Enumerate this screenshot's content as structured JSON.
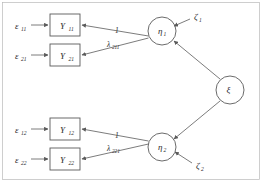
{
  "diagram": {
    "type": "sem-path-diagram",
    "colors": {
      "stroke": "#5a5a5a",
      "text": "#2b2b2b",
      "background": "#ffffff",
      "frame": "#b9b9b9"
    },
    "observed_variables": [
      {
        "id": "Y11",
        "base": "Y",
        "sub": "11",
        "x": 65,
        "y": 25
      },
      {
        "id": "Y21",
        "base": "Y",
        "sub": "21",
        "x": 65,
        "y": 55
      },
      {
        "id": "Y12",
        "base": "Y",
        "sub": "12",
        "x": 65,
        "y": 129
      },
      {
        "id": "Y22",
        "base": "Y",
        "sub": "22",
        "x": 65,
        "y": 159
      }
    ],
    "latent_variables": [
      {
        "id": "eta1",
        "base": "η",
        "sub": "1",
        "x": 162,
        "y": 31
      },
      {
        "id": "eta2",
        "base": "η",
        "sub": "2",
        "x": 162,
        "y": 147
      },
      {
        "id": "xi",
        "base": "ξ",
        "sub": "",
        "x": 230,
        "y": 90
      }
    ],
    "error_terms": [
      {
        "id": "eps11",
        "base": "ε",
        "sub": "11",
        "x": 22,
        "y": 25
      },
      {
        "id": "eps21",
        "base": "ε",
        "sub": "21",
        "x": 22,
        "y": 55
      },
      {
        "id": "eps12",
        "base": "ε",
        "sub": "12",
        "x": 22,
        "y": 129
      },
      {
        "id": "eps22",
        "base": "ε",
        "sub": "22",
        "x": 22,
        "y": 159
      }
    ],
    "disturbance_terms": [
      {
        "id": "zeta1",
        "base": "ζ",
        "sub": "1",
        "x": 197,
        "y": 17
      },
      {
        "id": "zeta2",
        "base": "ζ",
        "sub": "2",
        "x": 199,
        "y": 166
      }
    ],
    "path_labels": [
      {
        "id": "loading-1-upper",
        "base": "1",
        "sub": "",
        "x": 117,
        "y": 33
      },
      {
        "id": "loading-lambda211",
        "base": "λ",
        "sub": "211",
        "x": 112,
        "y": 46
      },
      {
        "id": "loading-1-lower",
        "base": "1",
        "sub": "",
        "x": 117,
        "y": 138
      },
      {
        "id": "loading-lambda221",
        "base": "λ",
        "sub": "221",
        "x": 112,
        "y": 150
      }
    ]
  }
}
